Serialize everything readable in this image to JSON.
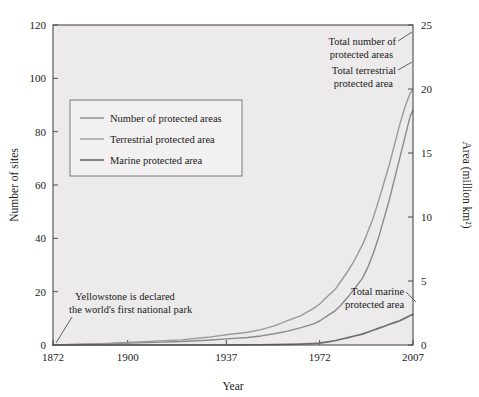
{
  "chart_data": {
    "type": "line",
    "title": "",
    "xlabel": "Year",
    "ylabel": "Number of sites",
    "y2label": "Area (million km²)",
    "xlim": [
      1872,
      2007
    ],
    "ylim": [
      0,
      120
    ],
    "y2lim": [
      0,
      25
    ],
    "grid": false,
    "legend_position": "upper-left-inside",
    "x_ticks": [
      "1872",
      "1900",
      "1937",
      "1972",
      "2007"
    ],
    "x_tick_values": [
      1872,
      1900,
      1937,
      1972,
      2007
    ],
    "y_ticks": [
      "0",
      "20",
      "40",
      "60",
      "80",
      "100",
      "120"
    ],
    "y_tick_values": [
      0,
      20,
      40,
      60,
      80,
      100,
      120
    ],
    "y2_ticks": [
      "0",
      "5",
      "10",
      "15",
      "20",
      "25"
    ],
    "y2_tick_values": [
      0,
      5,
      10,
      15,
      20,
      25
    ],
    "series": [
      {
        "name": "Number of protected areas",
        "axis": "left",
        "unit": "thousand sites",
        "color": "#8a8a8a",
        "x": [
          1872,
          1880,
          1890,
          1900,
          1910,
          1920,
          1930,
          1937,
          1945,
          1950,
          1955,
          1960,
          1965,
          1970,
          1972,
          1975,
          1978,
          1980,
          1983,
          1985,
          1988,
          1990,
          1992,
          1994,
          1996,
          1998,
          2000,
          2002,
          2004,
          2006,
          2007
        ],
        "values": [
          0,
          0.2,
          0.4,
          0.7,
          1.0,
          1.3,
          1.8,
          2.3,
          2.8,
          3.4,
          4.2,
          5.2,
          6.5,
          8.0,
          9.0,
          11.0,
          13.0,
          15.0,
          18.5,
          21.0,
          25.0,
          29.0,
          34.0,
          40.0,
          47.0,
          54.0,
          62.0,
          70.0,
          78.0,
          86.0,
          88.0
        ]
      },
      {
        "name": "Terrestrial protected area",
        "axis": "right",
        "unit": "million km²",
        "color": "#9a9a9a",
        "x": [
          1872,
          1880,
          1890,
          1900,
          1910,
          1920,
          1930,
          1937,
          1945,
          1950,
          1955,
          1960,
          1965,
          1970,
          1972,
          1975,
          1978,
          1980,
          1983,
          1985,
          1988,
          1990,
          1992,
          1994,
          1996,
          1998,
          2000,
          2002,
          2004,
          2006,
          2007
        ],
        "values": [
          0,
          0.05,
          0.1,
          0.2,
          0.3,
          0.4,
          0.6,
          0.8,
          1.0,
          1.2,
          1.5,
          1.9,
          2.3,
          2.9,
          3.2,
          3.8,
          4.4,
          5.0,
          5.9,
          6.6,
          7.8,
          8.8,
          9.9,
          11.2,
          12.6,
          14.0,
          15.6,
          17.2,
          18.6,
          19.7,
          20.0
        ]
      },
      {
        "name": "Marine protected area",
        "axis": "right",
        "unit": "million km²",
        "color": "#6f6f6f",
        "x": [
          1872,
          1900,
          1920,
          1937,
          1950,
          1960,
          1965,
          1970,
          1972,
          1975,
          1978,
          1980,
          1983,
          1985,
          1988,
          1990,
          1992,
          1994,
          1996,
          1998,
          2000,
          2002,
          2004,
          2006,
          2007
        ],
        "values": [
          0,
          0,
          0,
          0,
          0.02,
          0.05,
          0.08,
          0.12,
          0.15,
          0.25,
          0.35,
          0.45,
          0.6,
          0.7,
          0.85,
          1.0,
          1.15,
          1.3,
          1.45,
          1.6,
          1.75,
          1.9,
          2.1,
          2.3,
          2.4
        ]
      }
    ],
    "annotations": [
      {
        "id": "yellowstone",
        "lines": [
          "Yellowstone is declared",
          "the world's first national park"
        ],
        "points_to": {
          "x": 1872,
          "y_left": 0
        }
      },
      {
        "id": "total-number-of-protected-areas",
        "lines": [
          "Total number of",
          "protected areas"
        ],
        "points_to": {
          "x": 2007,
          "y_left": 88
        }
      },
      {
        "id": "total-terrestrial-protected-area",
        "lines": [
          "Total terrestrial",
          "protected area"
        ],
        "points_to": {
          "x": 2007,
          "y_right": 20
        }
      },
      {
        "id": "total-marine-protected-area",
        "lines": [
          "Total marine",
          "protected area"
        ],
        "points_to": {
          "x": 2007,
          "y_right": 2.4
        }
      }
    ],
    "legend_entries": [
      "Number of protected areas",
      "Terrestrial protected area",
      "Marine protected area"
    ],
    "colors": {
      "plot_background": "#eceaea",
      "figure_background": "#ffffff",
      "axis": "#4a4a4a",
      "text": "#1a1a1a",
      "legend_background": "#f2f0f0",
      "legend_border": "#7a7a7a"
    }
  }
}
